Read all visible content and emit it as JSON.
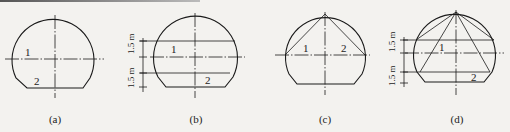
{
  "figure": {
    "panels": [
      {
        "id": "a",
        "caption": "(a)",
        "labels": [
          "1",
          "2"
        ],
        "dimensions": []
      },
      {
        "id": "b",
        "caption": "(b)",
        "labels": [
          "1",
          "2"
        ],
        "dimensions": [
          "1.5 m",
          "1.5 m"
        ]
      },
      {
        "id": "c",
        "caption": "(c)",
        "labels": [
          "1",
          "2"
        ],
        "dimensions": []
      },
      {
        "id": "d",
        "caption": "(d)",
        "labels": [
          "1",
          "2"
        ],
        "dimensions": [
          "1.5 m",
          "1.5 m"
        ]
      }
    ],
    "colors": {
      "line": "#1a1a1a",
      "background": "#f3f2ef"
    }
  }
}
